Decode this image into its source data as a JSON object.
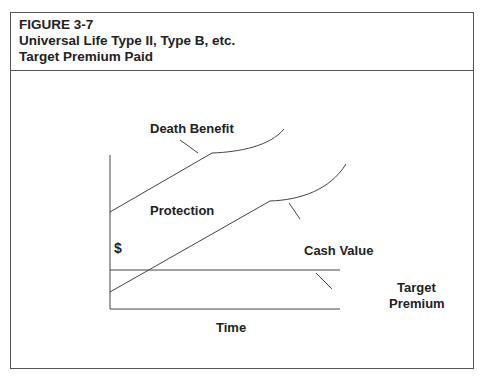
{
  "header": {
    "figure": "FIGURE 3-7",
    "title": "Universal Life Type II, Type B, etc.",
    "subtitle": "Target Premium Paid"
  },
  "diagram": {
    "y_axis_label": "$",
    "x_axis_label": "Time",
    "labels": {
      "death_benefit": "Death Benefit",
      "protection": "Protection",
      "cash_value": "Cash Value",
      "target_premium_1": "Target",
      "target_premium_2": "Premium"
    }
  }
}
